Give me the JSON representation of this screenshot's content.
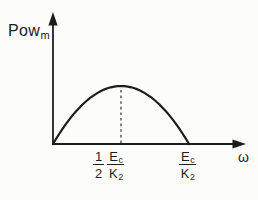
{
  "figure": {
    "ink_color": "#1d1d1b",
    "paper_color": "#fcfcfb",
    "y_axis_label": {
      "base": "Pow",
      "sub": "m"
    },
    "x_axis_label": "ω",
    "tick_half": {
      "coeff": {
        "num": "1",
        "den": "2"
      },
      "ratio": {
        "num_base": "E",
        "num_sub": "c",
        "den_base": "K",
        "den_sub": "2"
      }
    },
    "tick_full": {
      "ratio": {
        "num_base": "E",
        "num_sub": "c",
        "den_base": "K",
        "den_sub": "2"
      }
    }
  },
  "chart_data": {
    "type": "line",
    "title": "",
    "xlabel": "ω",
    "ylabel": "Pow_m",
    "x_unit": "multiples of E_c/K_2",
    "y_unit": "normalized to peak power",
    "x": [
      0,
      0.025,
      0.05,
      0.075,
      0.1,
      0.125,
      0.15,
      0.175,
      0.2,
      0.225,
      0.25,
      0.275,
      0.3,
      0.325,
      0.35,
      0.375,
      0.4,
      0.425,
      0.45,
      0.475,
      0.5,
      0.525,
      0.55,
      0.575,
      0.6,
      0.625,
      0.65,
      0.675,
      0.7,
      0.725,
      0.75,
      0.775,
      0.8,
      0.825,
      0.85,
      0.875,
      0.9,
      0.925,
      0.95,
      0.975,
      1
    ],
    "y": [
      0,
      0.0975,
      0.19,
      0.2775,
      0.36,
      0.4375,
      0.51,
      0.5775,
      0.64,
      0.6975,
      0.75,
      0.7975,
      0.84,
      0.8775,
      0.91,
      0.9375,
      0.96,
      0.9775,
      0.99,
      0.9975,
      1,
      0.9975,
      0.99,
      0.9775,
      0.96,
      0.9375,
      0.91,
      0.8775,
      0.84,
      0.7975,
      0.75,
      0.6975,
      0.64,
      0.5775,
      0.51,
      0.4375,
      0.36,
      0.2775,
      0.19,
      0.0975,
      0
    ],
    "xlim": [
      0,
      1.42
    ],
    "ylim": [
      0,
      2.26
    ],
    "grid": false,
    "legend": null,
    "x_ticks": [
      {
        "x": 0.5,
        "label": "(1/2)·(E_c/K_2)"
      },
      {
        "x": 1.0,
        "label": "E_c/K_2"
      }
    ],
    "peak": {
      "x": 0.5,
      "y": 1.0
    },
    "zeros": [
      0,
      1.0
    ],
    "annotations": [
      {
        "type": "dashed_vline",
        "x": 0.5,
        "y_from": 0,
        "y_to": 1.0
      }
    ]
  }
}
